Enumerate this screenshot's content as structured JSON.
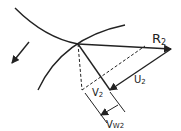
{
  "labels": {
    "r2": "R",
    "r2_sub": "2",
    "u2": "U",
    "u2_sub": "2",
    "v2": "V",
    "v2_sub": "2",
    "vw2": "V",
    "vw2_sub": "W2"
  },
  "colors": {
    "stroke": "#222222",
    "background": "#ffffff"
  }
}
